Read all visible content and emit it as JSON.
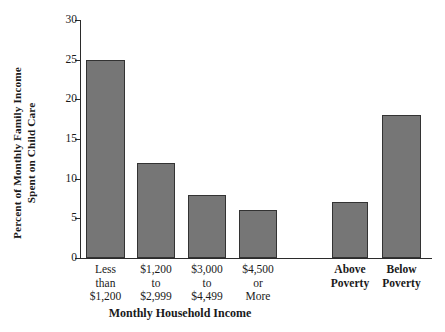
{
  "chart_data": {
    "type": "bar",
    "title": "",
    "xlabel": "Monthly Household Income",
    "ylabel": "Percent of Monthly Family Income Spent on Child Care",
    "ylabel_line1": "Percent of Monthly Family Income",
    "ylabel_line2": "Spent on Child Care",
    "categories": [
      "Less\nthan\n$1,200",
      "$1,200\nto\n$2,999",
      "$3,000\nto\n$4,499",
      "$4,500\nor\nMore",
      "Above\nPoverty",
      "Below\nPoverty"
    ],
    "values": [
      25,
      12,
      8,
      6,
      7,
      18
    ],
    "ylim": [
      0,
      30
    ],
    "yticks": [
      0,
      5,
      10,
      15,
      20,
      25,
      30
    ],
    "ytick_labels": [
      "0",
      "5",
      "10",
      "15",
      "20",
      "25",
      "30"
    ],
    "grid": false,
    "legend": "none",
    "bar_color": "#767676",
    "bar_edge_color": "#333333",
    "axis_color": "#2b2b2b",
    "background_color": "#ffffff",
    "groups": [
      {
        "name": "Monthly Household Income",
        "bold_labels": false,
        "bars": [
          {
            "label": "Less\nthan\n$1,200",
            "value": 25
          },
          {
            "label": "$1,200\nto\n$2,999",
            "value": 12
          },
          {
            "label": "$3,000\nto\n$4,499",
            "value": 8
          },
          {
            "label": "$4,500\nor\nMore",
            "value": 6
          }
        ]
      },
      {
        "name": "Poverty Status",
        "bold_labels": true,
        "bars": [
          {
            "label": "Above\nPoverty",
            "value": 7
          },
          {
            "label": "Below\nPoverty",
            "value": 18
          }
        ]
      }
    ]
  }
}
